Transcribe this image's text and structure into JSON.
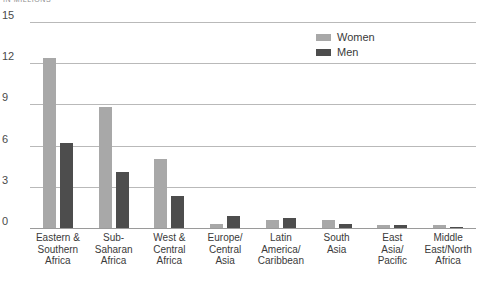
{
  "unit_caption": "IN MILLIONS",
  "legend": {
    "position": "top-right",
    "entries": [
      {
        "name": "women-legend",
        "label": "Women",
        "color": "#a8a8a8"
      },
      {
        "name": "men-legend",
        "label": "Men",
        "color": "#4d4d4d"
      }
    ]
  },
  "chart_data": {
    "type": "bar",
    "title": "",
    "subtitle": "",
    "xlabel": "",
    "ylabel": "IN MILLIONS",
    "ylim": [
      0,
      15
    ],
    "yticks": [
      "0",
      "3",
      "6",
      "9",
      "12",
      "15"
    ],
    "ytick_values": [
      0,
      3,
      6,
      9,
      12,
      15
    ],
    "grid": true,
    "legend_position": "top-right",
    "categories": [
      "Eastern &\nSouthern\nAfrica",
      "Sub-\nSaharan\nAfrica",
      "West &\nCentral\nAfrica",
      "Europe/\nCentral\nAsia",
      "Latin\nAmerica/\nCaribbean",
      "South\nAsia",
      "East\nAsia/\nPacific",
      "Middle\nEast/North\nAfrica"
    ],
    "series": [
      {
        "name": "Women",
        "color": "#a8a8a8",
        "values": [
          12.4,
          8.8,
          5.0,
          0.3,
          0.6,
          0.6,
          0.2,
          0.2
        ]
      },
      {
        "name": "Men",
        "color": "#4d4d4d",
        "values": [
          6.2,
          4.1,
          2.3,
          0.9,
          0.7,
          0.3,
          0.2,
          0.1
        ]
      }
    ]
  }
}
